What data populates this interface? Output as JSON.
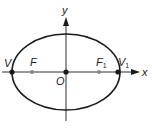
{
  "diagram": {
    "type": "ellipse-with-foci",
    "colors": {
      "stroke": "#1a1a1a",
      "focus": "#888888",
      "background": "#ffffff"
    },
    "axes": {
      "x_label": "x",
      "y_label": "y"
    },
    "ellipse": {
      "cx": 66,
      "cy": 72,
      "rx": 54,
      "ry": 38
    },
    "points": [
      {
        "name": "V",
        "label": "V",
        "sub": "",
        "x": 12,
        "y": 72,
        "kind": "vertex"
      },
      {
        "name": "F",
        "label": "F",
        "sub": "",
        "x": 32,
        "y": 72,
        "kind": "focus"
      },
      {
        "name": "O",
        "label": "O",
        "sub": "",
        "x": 66,
        "y": 72,
        "kind": "origin"
      },
      {
        "name": "F1",
        "label": "F",
        "sub": "1",
        "x": 99,
        "y": 72,
        "kind": "focus"
      },
      {
        "name": "V1",
        "label": "V",
        "sub": "1",
        "x": 118,
        "y": 72,
        "kind": "vertex"
      }
    ]
  }
}
